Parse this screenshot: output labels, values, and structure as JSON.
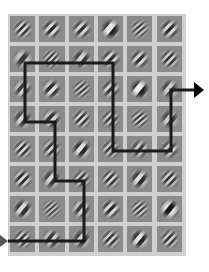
{
  "figure": {
    "grid": {
      "rows": 8,
      "cols": 6,
      "origin_x": 10,
      "origin_y": 16,
      "pitch_x": 29.3,
      "pitch_y": 30,
      "cell_size": 25,
      "frame_color": "#cfcfcf",
      "cell_color": "#8b8b8b"
    },
    "gabors": [
      [
        {
          "angle": 45,
          "freq": 5,
          "contrast": 0.8
        },
        {
          "angle": 45,
          "freq": 4,
          "contrast": 0.85
        },
        {
          "angle": 45,
          "freq": 4,
          "contrast": 0.8
        },
        {
          "angle": 40,
          "freq": 2.2,
          "contrast": 1.0
        },
        {
          "angle": 50,
          "freq": 6,
          "contrast": 0.7
        },
        {
          "angle": 45,
          "freq": 4,
          "contrast": 0.85
        }
      ],
      [
        {
          "angle": 40,
          "freq": 2.5,
          "contrast": 0.7
        },
        {
          "angle": 45,
          "freq": 6,
          "contrast": 0.75
        },
        {
          "angle": 40,
          "freq": 3,
          "contrast": 0.75
        },
        {
          "angle": 45,
          "freq": 4,
          "contrast": 0.8
        },
        {
          "angle": 45,
          "freq": 4,
          "contrast": 0.8
        },
        {
          "angle": 45,
          "freq": 5,
          "contrast": 0.8
        }
      ],
      [
        {
          "angle": 40,
          "freq": 3.5,
          "contrast": 0.7
        },
        {
          "angle": 45,
          "freq": 3.5,
          "contrast": 0.85
        },
        {
          "angle": 50,
          "freq": 6,
          "contrast": 0.7
        },
        {
          "angle": 45,
          "freq": 4,
          "contrast": 0.75
        },
        {
          "angle": 40,
          "freq": 2.2,
          "contrast": 1.0
        },
        {
          "angle": 40,
          "freq": 3,
          "contrast": 0.7
        }
      ],
      [
        {
          "angle": 40,
          "freq": 3,
          "contrast": 0.75
        },
        {
          "angle": 45,
          "freq": 3.5,
          "contrast": 0.8
        },
        {
          "angle": 45,
          "freq": 5,
          "contrast": 0.8
        },
        {
          "angle": 45,
          "freq": 5,
          "contrast": 0.7
        },
        {
          "angle": 50,
          "freq": 6,
          "contrast": 0.75
        },
        {
          "angle": 40,
          "freq": 3,
          "contrast": 0.7
        }
      ],
      [
        {
          "angle": 45,
          "freq": 5,
          "contrast": 0.8
        },
        {
          "angle": 45,
          "freq": 4.5,
          "contrast": 0.75
        },
        {
          "angle": 40,
          "freq": 3,
          "contrast": 0.9
        },
        {
          "angle": 45,
          "freq": 5,
          "contrast": 0.7
        },
        {
          "angle": 40,
          "freq": 4,
          "contrast": 0.7
        },
        {
          "angle": 45,
          "freq": 4,
          "contrast": 0.7
        }
      ],
      [
        {
          "angle": 45,
          "freq": 4.5,
          "contrast": 0.85
        },
        {
          "angle": 40,
          "freq": 3,
          "contrast": 0.75
        },
        {
          "angle": 45,
          "freq": 5,
          "contrast": 0.7
        },
        {
          "angle": 45,
          "freq": 5,
          "contrast": 0.8
        },
        {
          "angle": 40,
          "freq": 3,
          "contrast": 0.85
        },
        {
          "angle": 45,
          "freq": 5,
          "contrast": 0.8
        }
      ],
      [
        {
          "angle": 40,
          "freq": 3,
          "contrast": 0.85
        },
        {
          "angle": 50,
          "freq": 6.5,
          "contrast": 0.65
        },
        {
          "angle": 40,
          "freq": 3.5,
          "contrast": 0.75
        },
        {
          "angle": 45,
          "freq": 4,
          "contrast": 0.85
        },
        {
          "angle": 50,
          "freq": 6,
          "contrast": 0.7
        },
        {
          "angle": 40,
          "freq": 2.5,
          "contrast": 1.0
        }
      ],
      [
        {
          "angle": 45,
          "freq": 5,
          "contrast": 0.75
        },
        {
          "angle": 40,
          "freq": 3.5,
          "contrast": 0.75
        },
        {
          "angle": 40,
          "freq": 3,
          "contrast": 0.75
        },
        {
          "angle": 45,
          "freq": 5,
          "contrast": 0.8
        },
        {
          "angle": 40,
          "freq": 3,
          "contrast": 0.9
        },
        {
          "angle": 45,
          "freq": 5,
          "contrast": 0.75
        }
      ]
    ],
    "path": {
      "color": "#1a1a1a",
      "width": 3,
      "points": [
        [
          8,
          241
        ],
        [
          84,
          241
        ],
        [
          84,
          181
        ],
        [
          55,
          181
        ],
        [
          55,
          122
        ],
        [
          25,
          122
        ],
        [
          25,
          63
        ],
        [
          113,
          63
        ],
        [
          113,
          151
        ],
        [
          171,
          151
        ],
        [
          171,
          90
        ],
        [
          194,
          90
        ]
      ]
    },
    "start_marker": {
      "x": 0,
      "y": 241,
      "color": "#555555",
      "shape": "arrowhead-right"
    },
    "end_arrow": {
      "x": 194,
      "y": 90,
      "color": "#000000",
      "shape": "arrowhead-right"
    }
  }
}
